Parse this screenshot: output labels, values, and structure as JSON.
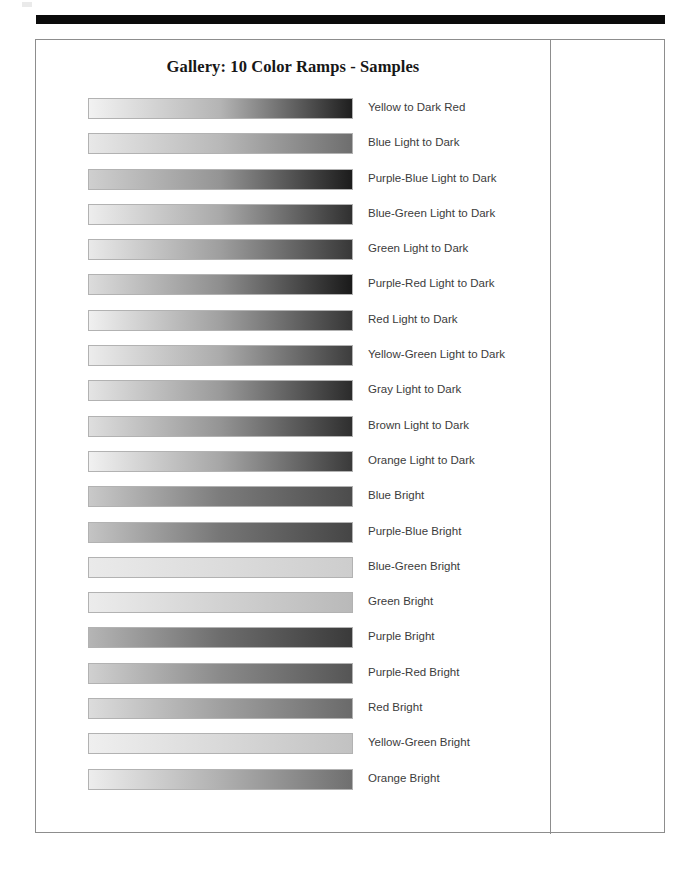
{
  "document": {
    "title": "Gallery: 10 Color Ramps - Samples",
    "page_background": "#ffffff",
    "frame_border_color": "#8d8d8d",
    "top_rule_color": "#0b0b0b",
    "label_color": "#3c3c3c"
  },
  "chart_data": {
    "type": "table",
    "title": "Gallery: 10 Color Ramps - Samples",
    "xlabel": "",
    "ylabel": "",
    "legend_position": "right",
    "grid": false,
    "columns": [
      "Sample",
      "Ramp Name"
    ],
    "categories": [
      "Yellow to Dark Red",
      "Blue Light to Dark",
      "Purple-Blue Light to Dark",
      "Blue-Green Light to Dark",
      "Green Light to Dark",
      "Purple-Red Light to Dark",
      "Red Light to Dark",
      "Yellow-Green Light to Dark",
      "Gray Light to Dark",
      "Brown Light to Dark",
      "Orange Light to Dark",
      "Blue Bright",
      "Purple-Blue Bright",
      "Blue-Green Bright",
      "Green Bright",
      "Purple Bright",
      "Purple-Red Bright",
      "Red Bright",
      "Yellow-Green Bright",
      "Orange Bright"
    ],
    "ramps": [
      {
        "name": "Yellow to Dark Red",
        "start_gray": "#f2f2f2",
        "mid_gray": "#b4b4b4",
        "end_gray": "#1f1f1f"
      },
      {
        "name": "Blue Light to Dark",
        "start_gray": "#e8e8e8",
        "mid_gray": "#b8b8b8",
        "end_gray": "#6e6e6e"
      },
      {
        "name": "Purple-Blue Light to Dark",
        "start_gray": "#cfcfcf",
        "mid_gray": "#949494",
        "end_gray": "#1c1c1c"
      },
      {
        "name": "Blue-Green Light to Dark",
        "start_gray": "#ededed",
        "mid_gray": "#a9a9a9",
        "end_gray": "#303030"
      },
      {
        "name": "Green Light to Dark",
        "start_gray": "#e9e9e9",
        "mid_gray": "#9e9e9e",
        "end_gray": "#383838"
      },
      {
        "name": "Purple-Red Light to Dark",
        "start_gray": "#dcdcdc",
        "mid_gray": "#8e8e8e",
        "end_gray": "#1a1a1a"
      },
      {
        "name": "Red Light to Dark",
        "start_gray": "#f0f0f0",
        "mid_gray": "#a0a0a0",
        "end_gray": "#363636"
      },
      {
        "name": "Yellow-Green Light to Dark",
        "start_gray": "#ececec",
        "mid_gray": "#ababab",
        "end_gray": "#3d3d3d"
      },
      {
        "name": "Gray Light to Dark",
        "start_gray": "#e4e4e4",
        "mid_gray": "#9a9a9a",
        "end_gray": "#2b2b2b"
      },
      {
        "name": "Brown Light to Dark",
        "start_gray": "#dedede",
        "mid_gray": "#949494",
        "end_gray": "#2f2f2f"
      },
      {
        "name": "Orange Light to Dark",
        "start_gray": "#f1f1f1",
        "mid_gray": "#a6a6a6",
        "end_gray": "#3a3a3a"
      },
      {
        "name": "Blue Bright",
        "start_gray": "#c9c9c9",
        "mid_gray": "#7c7c7c",
        "end_gray": "#4c4c4c"
      },
      {
        "name": "Purple-Blue Bright",
        "start_gray": "#c4c4c4",
        "mid_gray": "#767676",
        "end_gray": "#454545"
      },
      {
        "name": "Blue-Green Bright",
        "start_gray": "#eaeaea",
        "mid_gray": "#dcdcdc",
        "end_gray": "#cdcdcd"
      },
      {
        "name": "Green Bright",
        "start_gray": "#ececec",
        "mid_gray": "#d2d2d2",
        "end_gray": "#b9b9b9"
      },
      {
        "name": "Purple Bright",
        "start_gray": "#b5b5b5",
        "mid_gray": "#6d6d6d",
        "end_gray": "#3a3a3a"
      },
      {
        "name": "Purple-Red Bright",
        "start_gray": "#d0d0d0",
        "mid_gray": "#8a8a8a",
        "end_gray": "#555555"
      },
      {
        "name": "Red Bright",
        "start_gray": "#dcdcdc",
        "mid_gray": "#a0a0a0",
        "end_gray": "#6a6a6a"
      },
      {
        "name": "Yellow-Green Bright",
        "start_gray": "#efefef",
        "mid_gray": "#d9d9d9",
        "end_gray": "#c2c2c2"
      },
      {
        "name": "Orange Bright",
        "start_gray": "#ededed",
        "mid_gray": "#b0b0b0",
        "end_gray": "#6f6f6f"
      }
    ]
  }
}
